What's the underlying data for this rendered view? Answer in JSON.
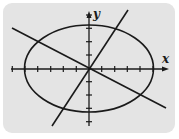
{
  "diagram": {
    "type": "ellipse with two lines through origin on coordinate axes",
    "axes": {
      "x_label": "x",
      "y_label": "y",
      "x_ticks": [
        -6,
        -5,
        -4,
        -3,
        -2,
        -1,
        1,
        2,
        3,
        4,
        5
      ],
      "y_ticks": [
        4,
        3,
        2,
        1,
        -1,
        -2,
        -3,
        -4
      ],
      "x_range": [
        -6,
        6
      ],
      "y_range": [
        -4.2,
        4.2
      ]
    },
    "ellipse": {
      "center": [
        0,
        0
      ],
      "semi_major_x": 5,
      "semi_minor_y": 3.3
    },
    "lines": [
      {
        "name": "line-positive-slope",
        "slope": 1.9,
        "through": [
          0,
          0
        ]
      },
      {
        "name": "line-negative-slope",
        "slope": -0.53,
        "through": [
          0,
          0
        ]
      }
    ],
    "colors": {
      "background": "#e4e4e4",
      "stroke": "#1a1a1a",
      "page": "#ffffff"
    }
  }
}
